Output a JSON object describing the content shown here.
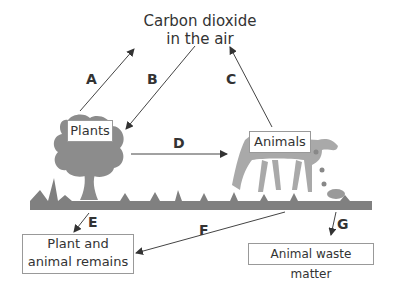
{
  "diagram": {
    "type": "carbon-cycle",
    "nodes": {
      "air": "Carbon dioxide\nin the air",
      "air_line1": "Carbon dioxide",
      "air_line2": "in the air",
      "plants": "Plants",
      "animals": "Animals",
      "remains_line1": "Plant and",
      "remains_line2": "animal remains",
      "waste": "Animal waste matter"
    },
    "arrows": [
      {
        "label": "A",
        "from": "Plants",
        "to": "Carbon dioxide in the air"
      },
      {
        "label": "B",
        "from": "Carbon dioxide in the air",
        "to": "Plants"
      },
      {
        "label": "C",
        "from": "Animals",
        "to": "Carbon dioxide in the air"
      },
      {
        "label": "D",
        "from": "Plants",
        "to": "Animals"
      },
      {
        "label": "E",
        "from": "Plants",
        "to": "Plant and animal remains"
      },
      {
        "label": "F",
        "from": "Animals",
        "to": "Plant and animal remains"
      },
      {
        "label": "G",
        "from": "Animals",
        "to": "Animal waste matter"
      }
    ],
    "labels": {
      "a": "A",
      "b": "B",
      "c": "C",
      "d": "D",
      "e": "E",
      "f": "F",
      "g": "G"
    },
    "colors": {
      "illustration": "#8a8a8a",
      "ground": "#7d7d7d",
      "arrow": "#444444",
      "box_border": "#999999"
    }
  }
}
